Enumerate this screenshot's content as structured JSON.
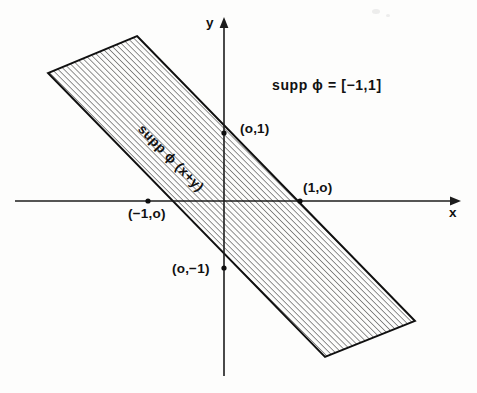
{
  "figure": {
    "type": "math-diagram",
    "background_color": "#fdfdfc",
    "ink_color": "#111111",
    "axes": {
      "x_axis_label": "x",
      "y_axis_label": "y",
      "origin_px": [
        224,
        201
      ],
      "x_axis_from_px": [
        15,
        201
      ],
      "x_axis_to_px": [
        457,
        201
      ],
      "y_axis_from_px": [
        224,
        18
      ],
      "y_axis_to_px": [
        224,
        376
      ],
      "arrowheads": [
        "x-positive",
        "y-positive"
      ]
    },
    "formula": "supp ϕ = [−1,1]",
    "band_label": "supp ϕ (x+y)",
    "point_labels": [
      {
        "name": "point-0-1",
        "text": "(o,1)",
        "x_px": 240,
        "y_px": 122
      },
      {
        "name": "point-1-0",
        "text": "(1,o)",
        "x_px": 303,
        "y_px": 181
      },
      {
        "name": "point-neg1-0",
        "text": "(−1,o)",
        "x_px": 128,
        "y_px": 207
      },
      {
        "name": "point-0-neg1",
        "text": "(o,−1)",
        "x_px": 172,
        "y_px": 262
      }
    ],
    "band": {
      "description": "hatched strip = support of phi(x+y), bounded by x+y=1 and x+y=-1",
      "upper_edge_line": "x + y = 1",
      "lower_edge_line": "x + y = -1",
      "upper_edge_px": [
        [
          137,
          36
        ],
        [
          415,
          321
        ]
      ],
      "lower_edge_px": [
        [
          48,
          73
        ],
        [
          325,
          357
        ]
      ],
      "hatch_angle_deg": 45,
      "hatch_spacing_px": 4.2,
      "hatch_color": "#2b2b2b"
    },
    "marked_intersections_px": [
      [
        224,
        133
      ],
      [
        300,
        201
      ],
      [
        148,
        201
      ],
      [
        224,
        268
      ]
    ]
  }
}
